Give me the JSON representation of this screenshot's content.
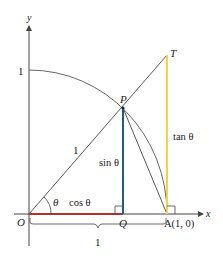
{
  "diagram": {
    "axes": {
      "x_label": "x",
      "y_label": "y"
    },
    "points": {
      "origin": "O",
      "P": "P",
      "Q": "Q",
      "A": "A(1, 0)",
      "T": "T"
    },
    "labels": {
      "y_tick_one": "1",
      "radius": "1",
      "theta": "θ",
      "cos": "cos θ",
      "sin": "sin θ",
      "tan": "tan θ",
      "brace_one": "1"
    },
    "colors": {
      "cos_segment": "#b5302a",
      "sin_segment": "#1f5d8c",
      "tan_segment": "#f1d34a",
      "lines": "#444444"
    }
  }
}
